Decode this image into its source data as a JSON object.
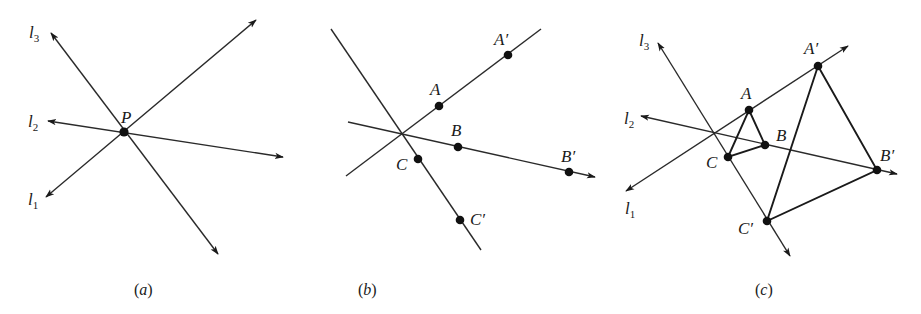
{
  "figure": {
    "ink_color": "#1a1a1a",
    "background": "#ffffff",
    "panels": [
      {
        "id": "a",
        "caption_letter": "a",
        "lines": [
          {
            "name": "l1",
            "label": "l",
            "subscript": "1"
          },
          {
            "name": "l2",
            "label": "l",
            "subscript": "2"
          },
          {
            "name": "l3",
            "label": "l",
            "subscript": "3"
          }
        ],
        "points": [
          {
            "name": "P",
            "label": "P"
          }
        ]
      },
      {
        "id": "b",
        "caption_letter": "b",
        "points": [
          {
            "name": "A",
            "label": "A"
          },
          {
            "name": "A-prime",
            "label": "A′"
          },
          {
            "name": "B",
            "label": "B"
          },
          {
            "name": "B-prime",
            "label": "B′"
          },
          {
            "name": "C",
            "label": "C"
          },
          {
            "name": "C-prime",
            "label": "C′"
          }
        ]
      },
      {
        "id": "c",
        "caption_letter": "c",
        "lines": [
          {
            "name": "l1",
            "label": "l",
            "subscript": "1"
          },
          {
            "name": "l2",
            "label": "l",
            "subscript": "2"
          },
          {
            "name": "l3",
            "label": "l",
            "subscript": "3"
          }
        ],
        "points": [
          {
            "name": "A",
            "label": "A"
          },
          {
            "name": "A-prime",
            "label": "A′"
          },
          {
            "name": "B",
            "label": "B"
          },
          {
            "name": "B-prime",
            "label": "B′"
          },
          {
            "name": "C",
            "label": "C"
          },
          {
            "name": "C-prime",
            "label": "C′"
          }
        ],
        "triangles": [
          [
            "A",
            "B",
            "C"
          ],
          [
            "A-prime",
            "B-prime",
            "C-prime"
          ]
        ]
      }
    ],
    "caption_open": "(",
    "caption_close": ")"
  }
}
